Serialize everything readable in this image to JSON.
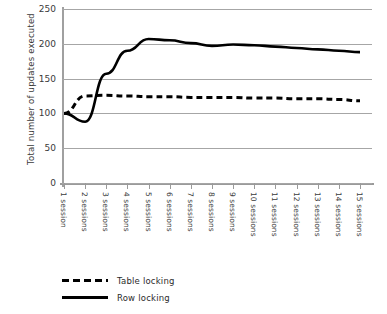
{
  "chart_data": {
    "type": "line",
    "title": "",
    "xlabel": "",
    "ylabel": "Total number of updates executed",
    "ylim": [
      0,
      250
    ],
    "yticks": [
      0,
      50,
      100,
      150,
      200,
      250
    ],
    "grid": true,
    "legend_position": "bottom-left",
    "categories": [
      "1 session",
      "2 sessions",
      "3 sessions",
      "4 sessions",
      "5 sessions",
      "6 sessions",
      "7 sessions",
      "8 sessions",
      "9 sessions",
      "10 sessions",
      "11 sessions",
      "12 sessions",
      "13 sessions",
      "14 sessions",
      "15 sessions"
    ],
    "series": [
      {
        "name": "Table locking",
        "style": "dashed",
        "color": "#000000",
        "values": [
          100,
          125,
          126,
          125,
          124,
          124,
          123,
          123,
          123,
          122,
          122,
          121,
          121,
          120,
          118
        ]
      },
      {
        "name": "Row locking",
        "style": "solid",
        "color": "#000000",
        "values": [
          100,
          88,
          157,
          190,
          207,
          205,
          201,
          197,
          199,
          198,
          196,
          194,
          192,
          190,
          188
        ]
      }
    ]
  },
  "axis": {
    "y_tick_labels": [
      "250",
      "200",
      "150",
      "100",
      "50",
      "0"
    ],
    "y_title": "Total number of updates executed"
  },
  "legend": {
    "items": [
      {
        "label": "Table locking",
        "style": "dashed"
      },
      {
        "label": "Row locking",
        "style": "solid"
      }
    ]
  }
}
